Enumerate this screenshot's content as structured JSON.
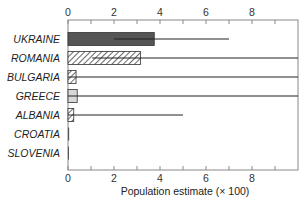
{
  "chart_data": {
    "type": "bar",
    "orientation": "horizontal",
    "title": "",
    "xlabel": "Population estimate (× 100)",
    "ylabel": "",
    "xlim": [
      0,
      10
    ],
    "x_ticks": [
      0,
      2,
      4,
      6,
      8
    ],
    "x_ticks_top": [
      0,
      2,
      4,
      6,
      8
    ],
    "grid": false,
    "legend": null,
    "categories": [
      "UKRAINE",
      "ROMANIA",
      "BULGARIA",
      "GREECE",
      "ALBANIA",
      "CROATIA",
      "SLOVENIA"
    ],
    "values": [
      3.75,
      3.15,
      0.35,
      0.4,
      0.25,
      0.05,
      0.02
    ],
    "error_low": [
      2.0,
      1.05,
      0.0,
      0.0,
      0.0,
      0.0,
      0.0
    ],
    "error_high": [
      7.0,
      10.0,
      10.0,
      10.0,
      5.0,
      0.05,
      0.02
    ],
    "bar_styles": [
      "solid-dark",
      "hatched",
      "hatched",
      "light-solid",
      "hatched",
      "solid-dark",
      "solid-dark"
    ]
  },
  "colors": {
    "dark_bar": "#555555",
    "light_bar": "#d8d8d8",
    "hatch": "#444444",
    "axis": "#888888",
    "error": "#222222"
  }
}
